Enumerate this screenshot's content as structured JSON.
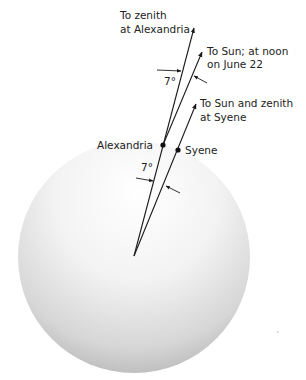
{
  "diagram": {
    "labels": {
      "zenith_alexandria_line1": "To zenith",
      "zenith_alexandria_line2": "at Alexandria",
      "sun_noon_line1": "To Sun; at noon",
      "sun_noon_line2": "on June 22",
      "sun_syene_line1": "To Sun and zenith",
      "sun_syene_line2": "at Syene",
      "alexandria": "Alexandria",
      "syene": "Syene",
      "angle_top": "7°",
      "angle_center": "7°"
    },
    "earth": {
      "center": [
        134,
        257
      ],
      "radius": 116,
      "fill_light": "#ffffff",
      "fill_dark": "#a9a9a9"
    },
    "points": {
      "alexandria": [
        163,
        145
      ],
      "syene": [
        178,
        150
      ]
    },
    "line_color": "#1a1a1a"
  }
}
